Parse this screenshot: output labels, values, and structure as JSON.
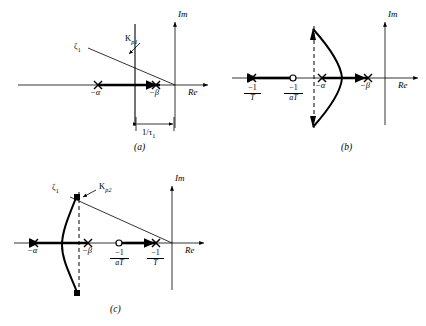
{
  "figure": {
    "background_color": "#ffffff",
    "stroke_color": "#000000"
  },
  "panels": [
    {
      "id": "a",
      "caption": "(a)",
      "axis_labels": {
        "real": "Re",
        "imag": "Im"
      },
      "pole_labels": [
        {
          "name": "alpha",
          "text": "−α"
        },
        {
          "name": "beta",
          "text": "−β"
        }
      ],
      "annotations": [
        {
          "name": "zeta-1",
          "text": "ζ",
          "sub": "1"
        },
        {
          "name": "gain-kp1",
          "text": "K",
          "sub": "p1"
        }
      ],
      "dimension": {
        "name": "tau-bracket",
        "numerator": "1",
        "denominator": "τ",
        "denominator_sub": "1",
        "text": "1/τ₁"
      }
    },
    {
      "id": "b",
      "caption": "(b)",
      "axis_labels": {
        "real": "Re",
        "imag": "Im"
      },
      "pole_labels": [
        {
          "name": "alpha",
          "text": "−α"
        },
        {
          "name": "beta",
          "text": "−β"
        }
      ],
      "fractions": [
        {
          "name": "neg-one-over-T",
          "num": "−1",
          "den": "T"
        },
        {
          "name": "neg-one-over-aT",
          "num": "−1",
          "den": "aT"
        }
      ]
    },
    {
      "id": "c",
      "caption": "(c)",
      "axis_labels": {
        "real": "Re",
        "imag": "Im"
      },
      "pole_labels": [
        {
          "name": "alpha",
          "text": "−α"
        },
        {
          "name": "beta",
          "text": "−β"
        }
      ],
      "annotations": [
        {
          "name": "zeta-1",
          "text": "ζ",
          "sub": "1"
        },
        {
          "name": "gain-kp2",
          "text": "K",
          "sub": "p2"
        }
      ],
      "fractions": [
        {
          "name": "neg-one-over-aT",
          "num": "−1",
          "den": "aT"
        },
        {
          "name": "neg-one-over-T",
          "num": "−1",
          "den": "T"
        }
      ]
    }
  ],
  "text": {
    "re": "Re",
    "im": "Im",
    "minus_alpha": "−α",
    "minus_beta": "−β",
    "zeta": "ζ",
    "K": "K",
    "sub_1": "1",
    "sub_p1": "p1",
    "sub_p2": "p2",
    "caption_a": "(a)",
    "caption_b": "(b)",
    "caption_c": "(c)",
    "one": "1",
    "tau": "τ",
    "neg_one": "−1",
    "T": "T",
    "aT": "aT"
  }
}
